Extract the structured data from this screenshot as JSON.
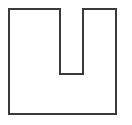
{
  "canvas": {
    "width": 132,
    "height": 125,
    "background_color": "#ffffff"
  },
  "figure": {
    "name": "u-shaped-notched-rectangle",
    "stroke_color": "#3a3a3a",
    "fill_color": "#ffffff",
    "stroke_width": 2,
    "outer_rect": {
      "left": 9,
      "top": 9,
      "right": 116,
      "bottom": 114,
      "width": 107,
      "height": 105
    },
    "notch": {
      "left": 60,
      "right": 83,
      "top": 9,
      "bottom": 74,
      "width": 23,
      "depth": 65
    },
    "left_tine": {
      "width": 51
    },
    "right_tine": {
      "width": 33
    },
    "base_height": 40,
    "path": "M 9 9 L 60 9 L 60 74 L 83 74 L 83 9 L 116 9 L 116 114 L 9 114 Z",
    "vertices": [
      {
        "label": "top-left-corner",
        "x": 9,
        "y": 9
      },
      {
        "label": "notch-top-left",
        "x": 60,
        "y": 9
      },
      {
        "label": "notch-bottom-left",
        "x": 60,
        "y": 74
      },
      {
        "label": "notch-bottom-right",
        "x": 83,
        "y": 74
      },
      {
        "label": "notch-top-right",
        "x": 83,
        "y": 9
      },
      {
        "label": "top-right-corner",
        "x": 116,
        "y": 9
      },
      {
        "label": "bottom-right-corner",
        "x": 116,
        "y": 114
      },
      {
        "label": "bottom-left-corner",
        "x": 9,
        "y": 114
      }
    ]
  }
}
